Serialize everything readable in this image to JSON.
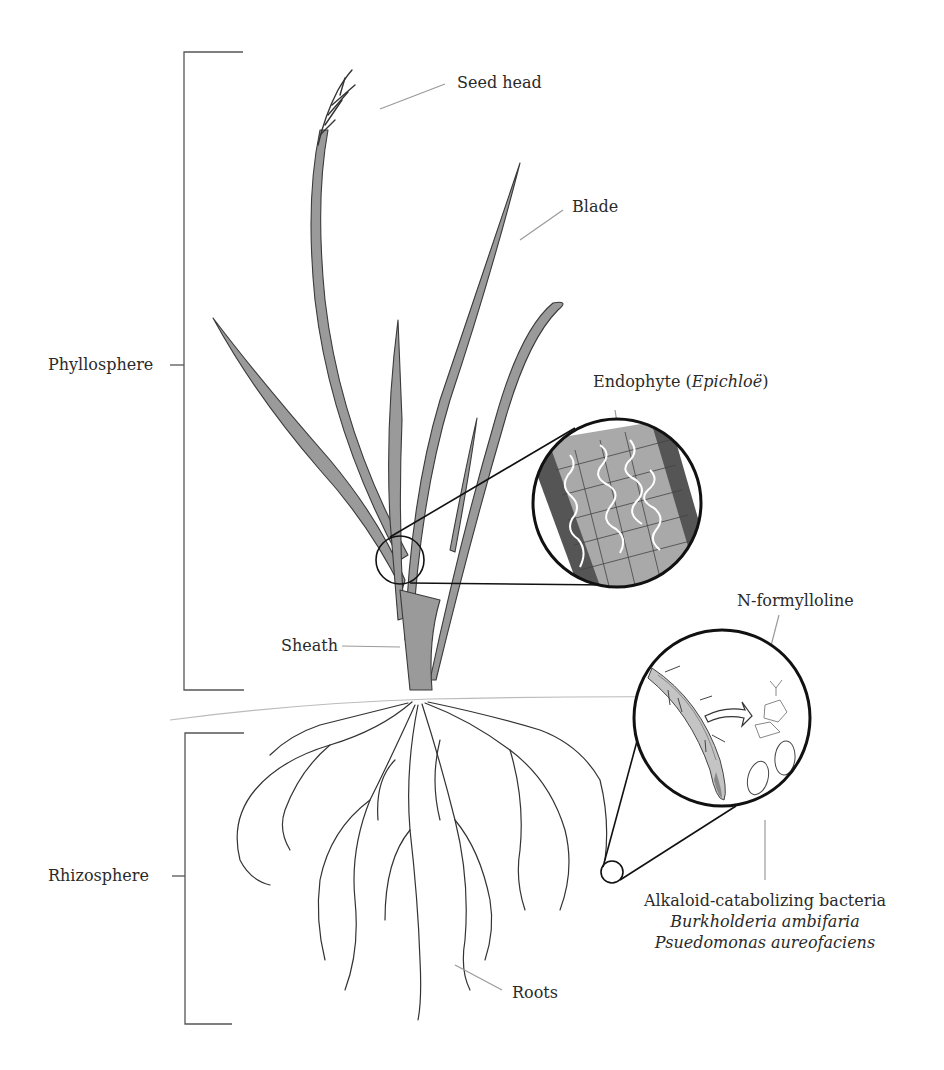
{
  "diagram": {
    "colors": {
      "leaf_fill": "#9a9a9a",
      "leaf_stroke": "#3a3a3a",
      "outline": "#111111",
      "leader_line": "#9a9a9a",
      "text": "#2a2a2a"
    },
    "regions": [
      {
        "id": "phyllosphere",
        "label": "Phyllosphere"
      },
      {
        "id": "rhizosphere",
        "label": "Rhizosphere"
      }
    ],
    "labels": {
      "seed_head": "Seed head",
      "blade": "Blade",
      "endophyte_prefix": "Endophyte (",
      "endophyte_genus": "Epichloë",
      "endophyte_suffix": ")",
      "sheath": "Sheath",
      "n_formylloline": "N-formylloline",
      "roots": "Roots",
      "bacteria_title": "Alkaloid-catabolizing bacteria",
      "bacteria_species": [
        "Burkholderia ambifaria",
        "Psuedomonas aureofaciens"
      ]
    },
    "callouts": [
      {
        "id": "endophyte-magnifier",
        "content": "Leaf tissue cross-section with fungal hyphae between plant cells"
      },
      {
        "id": "rhizosphere-magnifier",
        "content": "Root with N-formylloline alkaloid release and bacteria"
      }
    ]
  }
}
